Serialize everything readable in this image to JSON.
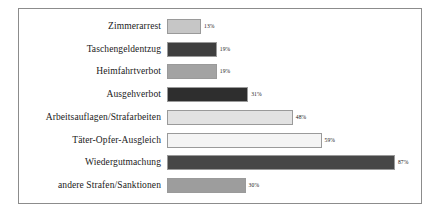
{
  "chart_data": {
    "type": "bar",
    "orientation": "horizontal",
    "title": "",
    "subtitle": "",
    "xlabel": "",
    "ylabel": "",
    "xlim": [
      0,
      100
    ],
    "grid": false,
    "legend": null,
    "axis_visible": false,
    "value_suffix": "%",
    "categories": [
      "Zimmerarrest",
      "Taschengeldentzug",
      "Heimfahrtverbot",
      "Ausgehverbot",
      "Arbeitsauflagen/Strafarbeiten",
      "Täter-Opfer-Ausgleich",
      "Wiedergutmachung",
      "andere Strafen/Sanktionen"
    ],
    "values": [
      13,
      19,
      19,
      31,
      48,
      59,
      87,
      30
    ],
    "value_labels": [
      "13%",
      "19%",
      "19%",
      "31%",
      "48%",
      "59%",
      "87%",
      "30%"
    ],
    "bar_colors": [
      "#c6c6c6",
      "#3f3f3f",
      "#a3a3a3",
      "#2e2e2e",
      "#e2e2e2",
      "#f4f4f4",
      "#474747",
      "#9d9d9d"
    ],
    "bar_border_color": "#9a9a9a",
    "frame_border_color": "#8c8c8c",
    "background_color": "#ffffff",
    "text_color": "#1a1a1a"
  }
}
